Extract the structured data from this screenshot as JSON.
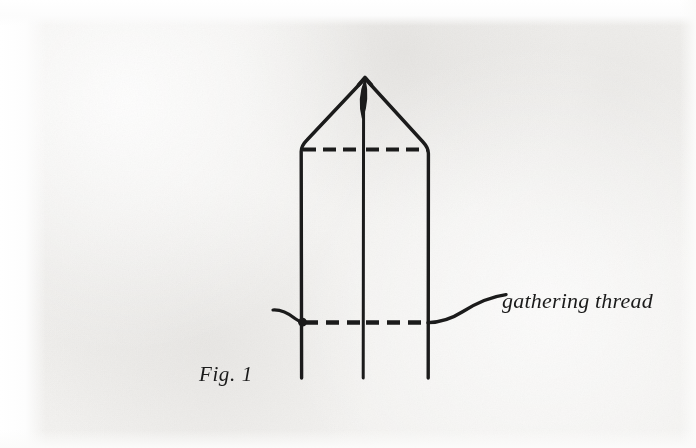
{
  "page": {
    "kind": "scanned-book-figure",
    "width": 696,
    "height": 448,
    "paper_color": "#f3f2f0",
    "ink_color": "#1b1b1b"
  },
  "figure": {
    "caption": "Fig. 1",
    "annotations": [
      {
        "id": "gathering-thread",
        "label": "gathering thread",
        "leader_line": true
      }
    ],
    "diagram": {
      "description": "folded paper column with pointed top, centre fold line, two dashed gathering lines and a thread",
      "apex": {
        "x": 365,
        "y": 78
      },
      "left_edge_x": 301,
      "center_fold_x": 363,
      "right_edge_x": 428,
      "body_bottom_y": 378,
      "shoulder_left": {
        "x": 301,
        "y": 147
      },
      "shoulder_right": {
        "x": 428,
        "y": 150
      },
      "dashed_lines": [
        {
          "id": "upper-dashed-fold",
          "y": 149,
          "x_start": 301,
          "x_end": 428
        },
        {
          "id": "lower-dashed-gather",
          "y": 322,
          "x_start": 302,
          "x_end": 428
        }
      ],
      "thread": {
        "knot": {
          "x": 302,
          "y": 322
        },
        "tail_left_start": {
          "x": 274,
          "y": 311
        },
        "tail_right_end": {
          "x": 505,
          "y": 295
        }
      },
      "needle_eye": {
        "x": 365,
        "top_y": 80,
        "bottom_y": 118
      }
    }
  },
  "colors": {
    "ink": "#1b1b1b",
    "paper": "#f3f2f0",
    "margin": "#ffffff"
  }
}
